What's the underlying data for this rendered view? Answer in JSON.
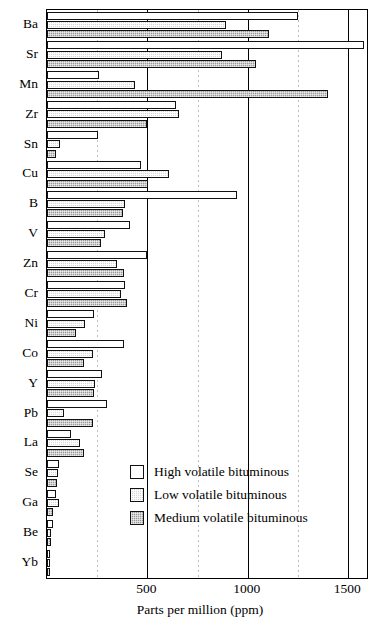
{
  "chart_data": {
    "type": "bar",
    "orientation": "horizontal",
    "title": "",
    "xlabel": "Parts per million (ppm)",
    "ylabel": "",
    "xlim": [
      0,
      1594
    ],
    "xticks": [
      500,
      1000,
      1500
    ],
    "xtick_labels": [
      "500",
      "1000",
      "1500"
    ],
    "minor_gridlines": [
      250,
      750,
      1250
    ],
    "grid": true,
    "legend_position": "center",
    "categories": [
      "Ba",
      "Sr",
      "Mn",
      "Zr",
      "Sn",
      "Cu",
      "B",
      "V",
      "Zn",
      "Cr",
      "Ni",
      "Co",
      "Y",
      "Pb",
      "La",
      "Se",
      "Ga",
      "Be",
      "Yb"
    ],
    "series": [
      {
        "name": "High volatile bituminous",
        "color": "#ffffff",
        "values": [
          1250,
          1580,
          260,
          645,
          255,
          470,
          945,
          415,
          500,
          390,
          235,
          385,
          275,
          300,
          120,
          60,
          45,
          28,
          12
        ]
      },
      {
        "name": "Low volatile bituminous",
        "color": "#d8d8d8",
        "values": [
          890,
          870,
          440,
          660,
          65,
          610,
          390,
          290,
          350,
          370,
          190,
          230,
          240,
          85,
          165,
          55,
          60,
          22,
          10
        ]
      },
      {
        "name": "Medium volatile bituminous",
        "color": "#9a9a9a",
        "values": [
          1105,
          1040,
          1400,
          500,
          45,
          505,
          380,
          270,
          385,
          400,
          145,
          185,
          235,
          230,
          185,
          50,
          30,
          18,
          14
        ]
      }
    ]
  },
  "legend": {
    "entries": [
      {
        "label": "High volatile bituminous",
        "key": "high"
      },
      {
        "label": "Low volatile bituminous",
        "key": "low"
      },
      {
        "label": "Medium volatile bituminous",
        "key": "med"
      }
    ]
  }
}
